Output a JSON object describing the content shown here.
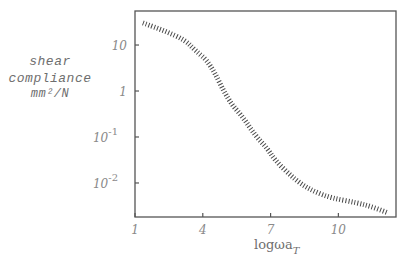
{
  "chart_data": {
    "type": "line",
    "title": "",
    "xlabel": {
      "main": "logωa",
      "subscript": "T"
    },
    "ylabel": [
      "shear",
      "compliance",
      "mm²/N"
    ],
    "x_scale": "linear",
    "y_scale": "log",
    "xlim": [
      1,
      12.55
    ],
    "ylim_log10": [
      -2.74,
      1.74
    ],
    "x_ticks": [
      {
        "value": 1,
        "label": "1"
      },
      {
        "value": 4,
        "label": "4"
      },
      {
        "value": 7,
        "label": "7"
      },
      {
        "value": 10,
        "label": "10"
      }
    ],
    "y_ticks": [
      {
        "log10": 1,
        "base": "10",
        "exp": ""
      },
      {
        "log10": 0,
        "base": "1",
        "exp": ""
      },
      {
        "log10": -1,
        "base": "10",
        "exp": "-1"
      },
      {
        "log10": -2,
        "base": "10",
        "exp": "-2"
      }
    ],
    "grid": false,
    "series": [
      {
        "name": "shear compliance",
        "style": "hatched",
        "x": [
          1.35,
          2.3,
          3.21,
          3.65,
          4.32,
          5.12,
          5.78,
          6.31,
          6.84,
          7.19,
          7.8,
          8.39,
          9.0,
          9.72,
          10.82,
          11.5,
          12.19
        ],
        "log10y": [
          1.48,
          1.31,
          1.11,
          0.89,
          0.61,
          -0.2,
          -0.57,
          -0.96,
          -1.24,
          -1.5,
          -1.8,
          -2.04,
          -2.2,
          -2.33,
          -2.43,
          -2.52,
          -2.65
        ]
      }
    ]
  }
}
